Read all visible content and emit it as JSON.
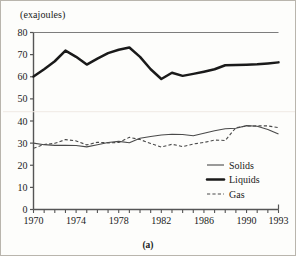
{
  "figure": {
    "caption": "(a)",
    "unit_label": "(exajoules)"
  },
  "chart_data": {
    "type": "line",
    "title": "",
    "subtitle": "",
    "xlabel": "",
    "ylabel": "(exajoules)",
    "xlim": [
      1970,
      1993
    ],
    "ylim": [
      0,
      80
    ],
    "grid": false,
    "legend_position": "bottom-right",
    "x": [
      1970,
      1971,
      1972,
      1973,
      1974,
      1975,
      1976,
      1977,
      1978,
      1979,
      1980,
      1981,
      1982,
      1983,
      1984,
      1985,
      1986,
      1987,
      1988,
      1989,
      1990,
      1991,
      1992,
      1993
    ],
    "xticks": [
      1970,
      1971,
      1972,
      1973,
      1974,
      1975,
      1976,
      1977,
      1978,
      1979,
      1980,
      1981,
      1982,
      1983,
      1984,
      1985,
      1986,
      1987,
      1988,
      1989,
      1990,
      1991,
      1992,
      1993
    ],
    "xtick_labels": [
      "1970",
      "",
      "",
      "",
      "1974",
      "",
      "",
      "",
      "1978",
      "",
      "",
      "",
      "1982",
      "",
      "",
      "",
      "1986",
      "",
      "",
      "",
      "1990",
      "",
      "",
      "1993"
    ],
    "yticks": [
      0,
      10,
      20,
      30,
      40,
      50,
      60,
      70,
      80
    ],
    "ytick_labels": [
      "0",
      "10",
      "20",
      "30",
      "40",
      "50",
      "60",
      "70",
      "80"
    ],
    "series": [
      {
        "name": "Solids",
        "style": "thin-solid",
        "color": "#4a4a4a",
        "values": [
          30.0,
          29.3,
          29.0,
          29.0,
          28.9,
          28.3,
          29.3,
          30.3,
          30.8,
          30.2,
          32.2,
          33.0,
          33.7,
          34.0,
          33.9,
          33.3,
          34.5,
          35.6,
          36.5,
          36.7,
          37.9,
          37.6,
          36.2,
          34.1
        ]
      },
      {
        "name": "Liquids",
        "style": "thick-solid",
        "color": "#1a1a1a",
        "values": [
          60.1,
          63.4,
          67.0,
          71.8,
          69.0,
          65.5,
          68.2,
          70.7,
          72.2,
          73.2,
          69.0,
          63.4,
          59.0,
          61.8,
          60.4,
          61.3,
          62.3,
          63.4,
          65.2,
          65.3,
          65.4,
          65.6,
          66.0,
          66.5
        ]
      },
      {
        "name": "Gas",
        "style": "dashed",
        "color": "#4a4a4a",
        "values": [
          27.7,
          29.4,
          29.9,
          31.6,
          31.0,
          29.2,
          30.4,
          30.1,
          30.3,
          32.6,
          31.6,
          29.8,
          28.2,
          29.5,
          28.4,
          29.6,
          30.3,
          31.4,
          31.2,
          37.0,
          37.7,
          37.8,
          37.8,
          37.0
        ]
      }
    ],
    "legend": [
      {
        "label": "Solids",
        "style": "thin-solid"
      },
      {
        "label": "Liquids",
        "style": "thick-solid"
      },
      {
        "label": "Gas",
        "style": "dashed"
      }
    ]
  }
}
